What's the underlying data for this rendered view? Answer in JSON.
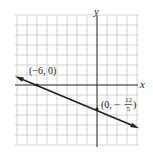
{
  "diagram": {
    "type": "coordinate-graph",
    "axes": {
      "x_label": "x",
      "y_label": "y"
    },
    "grid": {
      "x_range": [
        -8,
        4
      ],
      "y_range": [
        -6,
        6
      ],
      "unit": 1
    },
    "line": {
      "points": [
        {
          "label": "(−6, 0)",
          "x": -6,
          "y": 0
        },
        {
          "label_prefix": "(0, −",
          "numerator": "12",
          "denominator": "5",
          "label_suffix": ")",
          "x": 0,
          "y": -2.4
        }
      ],
      "arrows": "both"
    },
    "colors": {
      "grid": "#c8c8c8",
      "axis": "#222222",
      "line": "#222222"
    }
  }
}
